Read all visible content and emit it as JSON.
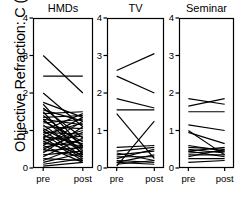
{
  "figure": {
    "ylabel": "Objective Refraction: C (D)",
    "x_tick_labels": [
      "pre",
      "post"
    ],
    "y_tick_labels": [
      "0",
      "1",
      "2",
      "3",
      "4"
    ],
    "panel_titles": [
      "HMDs",
      "TV",
      "Seminar"
    ],
    "axis_color": "#000000",
    "line_color": "#000000",
    "background": "#ffffff"
  },
  "chart_data": {
    "type": "line",
    "title": "",
    "subtitle": "",
    "xlabel": "",
    "ylabel": "Objective Refraction: C (D)",
    "x": [
      "pre",
      "post"
    ],
    "xtick_labels": [
      "pre",
      "post"
    ],
    "ytick_labels": [
      "0",
      "1",
      "2",
      "3",
      "4"
    ],
    "yticks": [
      0,
      1,
      2,
      3,
      4
    ],
    "ylim": [
      0,
      4
    ],
    "grid": false,
    "legend": "none",
    "layout": "3 side-by-side panels sharing the y axis, paired pre/post slope lines",
    "panels": [
      {
        "title": "HMDs",
        "n": 44,
        "series": [
          {
            "name": "s1",
            "values": [
              3.0,
              2.0
            ]
          },
          {
            "name": "s2",
            "values": [
              2.45,
              2.45
            ]
          },
          {
            "name": "s3",
            "values": [
              2.0,
              1.1
            ]
          },
          {
            "name": "s4",
            "values": [
              1.75,
              1.35
            ]
          },
          {
            "name": "s5",
            "values": [
              1.7,
              0.55
            ]
          },
          {
            "name": "s6",
            "values": [
              1.6,
              0.8
            ]
          },
          {
            "name": "s7",
            "values": [
              1.55,
              1.25
            ]
          },
          {
            "name": "s8",
            "values": [
              1.5,
              0.35
            ]
          },
          {
            "name": "s9",
            "values": [
              1.45,
              1.5
            ]
          },
          {
            "name": "s10",
            "values": [
              1.4,
              0.6
            ]
          },
          {
            "name": "s11",
            "values": [
              1.35,
              1.4
            ]
          },
          {
            "name": "s12",
            "values": [
              1.3,
              0.45
            ]
          },
          {
            "name": "s13",
            "values": [
              1.3,
              1.15
            ]
          },
          {
            "name": "s14",
            "values": [
              1.25,
              0.7
            ]
          },
          {
            "name": "s15",
            "values": [
              1.2,
              1.3
            ]
          },
          {
            "name": "s16",
            "values": [
              1.15,
              0.4
            ]
          },
          {
            "name": "s17",
            "values": [
              1.1,
              1.05
            ]
          },
          {
            "name": "s18",
            "values": [
              1.05,
              0.5
            ]
          },
          {
            "name": "s19",
            "values": [
              1.0,
              1.45
            ]
          },
          {
            "name": "s20",
            "values": [
              1.0,
              0.3
            ]
          },
          {
            "name": "s21",
            "values": [
              0.95,
              0.9
            ]
          },
          {
            "name": "s22",
            "values": [
              0.9,
              1.2
            ]
          },
          {
            "name": "s23",
            "values": [
              0.9,
              0.25
            ]
          },
          {
            "name": "s24",
            "values": [
              0.85,
              0.65
            ]
          },
          {
            "name": "s25",
            "values": [
              0.8,
              1.35
            ]
          },
          {
            "name": "s26",
            "values": [
              0.8,
              0.2
            ]
          },
          {
            "name": "s27",
            "values": [
              0.75,
              0.85
            ]
          },
          {
            "name": "s28",
            "values": [
              0.7,
              1.0
            ]
          },
          {
            "name": "s29",
            "values": [
              0.7,
              0.35
            ]
          },
          {
            "name": "s30",
            "values": [
              0.65,
              0.6
            ]
          },
          {
            "name": "s31",
            "values": [
              0.6,
              1.25
            ]
          },
          {
            "name": "s32",
            "values": [
              0.6,
              0.15
            ]
          },
          {
            "name": "s33",
            "values": [
              0.55,
              0.75
            ]
          },
          {
            "name": "s34",
            "values": [
              0.5,
              0.95
            ]
          },
          {
            "name": "s35",
            "values": [
              0.5,
              0.3
            ]
          },
          {
            "name": "s36",
            "values": [
              0.45,
              0.55
            ]
          },
          {
            "name": "s37",
            "values": [
              0.4,
              1.1
            ]
          },
          {
            "name": "s38",
            "values": [
              0.35,
              0.45
            ]
          },
          {
            "name": "s39",
            "values": [
              0.3,
              0.8
            ]
          },
          {
            "name": "s40",
            "values": [
              0.25,
              0.2
            ]
          },
          {
            "name": "s41",
            "values": [
              0.2,
              0.6
            ]
          },
          {
            "name": "s42",
            "values": [
              0.15,
              0.4
            ]
          },
          {
            "name": "s43",
            "values": [
              0.1,
              0.25
            ]
          },
          {
            "name": "s44",
            "values": [
              0.05,
              0.15
            ]
          }
        ]
      },
      {
        "title": "TV",
        "n": 16,
        "series": [
          {
            "name": "t1",
            "values": [
              2.6,
              3.05
            ]
          },
          {
            "name": "t2",
            "values": [
              2.45,
              2.0
            ]
          },
          {
            "name": "t3",
            "values": [
              1.85,
              1.6
            ]
          },
          {
            "name": "t4",
            "values": [
              1.55,
              1.55
            ]
          },
          {
            "name": "t5",
            "values": [
              1.45,
              0.25
            ]
          },
          {
            "name": "t6",
            "values": [
              0.55,
              0.6
            ]
          },
          {
            "name": "t7",
            "values": [
              0.45,
              0.55
            ]
          },
          {
            "name": "t8",
            "values": [
              0.4,
              0.2
            ]
          },
          {
            "name": "t9",
            "values": [
              0.35,
              0.45
            ]
          },
          {
            "name": "t10",
            "values": [
              0.3,
              0.3
            ]
          },
          {
            "name": "t11",
            "values": [
              0.25,
              0.5
            ]
          },
          {
            "name": "t12",
            "values": [
              0.2,
              0.15
            ]
          },
          {
            "name": "t13",
            "values": [
              0.15,
              0.35
            ]
          },
          {
            "name": "t14",
            "values": [
              0.15,
              0.1
            ]
          },
          {
            "name": "t15",
            "values": [
              0.1,
              0.2
            ]
          },
          {
            "name": "t16",
            "values": [
              0.05,
              1.25
            ]
          }
        ]
      },
      {
        "title": "Seminar",
        "n": 16,
        "series": [
          {
            "name": "m1",
            "values": [
              1.85,
              1.7
            ]
          },
          {
            "name": "m2",
            "values": [
              1.65,
              1.85
            ]
          },
          {
            "name": "m3",
            "values": [
              1.5,
              1.5
            ]
          },
          {
            "name": "m4",
            "values": [
              1.15,
              1.0
            ]
          },
          {
            "name": "m5",
            "values": [
              1.0,
              0.35
            ]
          },
          {
            "name": "m6",
            "values": [
              0.95,
              0.65
            ]
          },
          {
            "name": "m7",
            "values": [
              0.6,
              0.45
            ]
          },
          {
            "name": "m8",
            "values": [
              0.55,
              0.5
            ]
          },
          {
            "name": "m9",
            "values": [
              0.5,
              0.4
            ]
          },
          {
            "name": "m10",
            "values": [
              0.45,
              0.55
            ]
          },
          {
            "name": "m11",
            "values": [
              0.45,
              0.3
            ]
          },
          {
            "name": "m12",
            "values": [
              0.4,
              0.45
            ]
          },
          {
            "name": "m13",
            "values": [
              0.35,
              0.35
            ]
          },
          {
            "name": "m14",
            "values": [
              0.3,
              0.5
            ]
          },
          {
            "name": "m15",
            "values": [
              0.25,
              0.25
            ]
          },
          {
            "name": "m16",
            "values": [
              0.15,
              0.2
            ]
          }
        ]
      }
    ]
  }
}
